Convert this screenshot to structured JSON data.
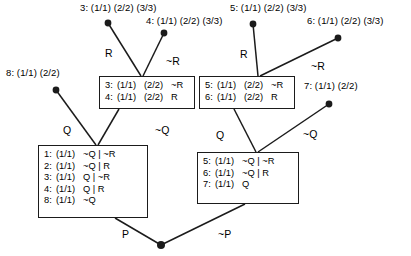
{
  "diagram": {
    "stroke_color": "#1b1b1b",
    "background": "#ffffff",
    "leaf_nodes": [
      {
        "name": "node-3",
        "label": "3: (1/1) (2/2) (3/3)",
        "label_x": 80,
        "label_y": 2,
        "dot_x": 108,
        "dot_y": 23
      },
      {
        "name": "node-4",
        "label": "4: (1/1) (2/2) (3/3)",
        "label_x": 146,
        "label_y": 15,
        "dot_x": 164,
        "dot_y": 33
      },
      {
        "name": "node-5",
        "label": "5: (1/1) (2/2) (3/3)",
        "label_x": 230,
        "label_y": 2,
        "dot_x": 253,
        "dot_y": 24
      },
      {
        "name": "node-6",
        "label": "6: (1/1) (2/2) (3/3)",
        "label_x": 307,
        "label_y": 15,
        "dot_x": 338,
        "dot_y": 38
      },
      {
        "name": "node-8",
        "label": "8: (1/1)  (2/2)",
        "label_x": 6,
        "label_y": 67,
        "dot_x": 56,
        "dot_y": 90
      },
      {
        "name": "node-7",
        "label": "7: (1/1)  (2/2)",
        "label_x": 304,
        "label_y": 80,
        "dot_x": 329,
        "dot_y": 104
      }
    ],
    "root_node": {
      "name": "root-node",
      "dot_x": 161,
      "dot_y": 245
    },
    "edge_labels": [
      {
        "name": "edge-label-r-left",
        "text": "R",
        "x": 105,
        "y": 47
      },
      {
        "name": "edge-label-not-r-left",
        "text": "~R",
        "x": 166,
        "y": 55
      },
      {
        "name": "edge-label-r-right",
        "text": "R",
        "x": 240,
        "y": 48
      },
      {
        "name": "edge-label-not-r-right",
        "text": "~R",
        "x": 311,
        "y": 60
      },
      {
        "name": "edge-label-q-left",
        "text": "Q",
        "x": 63,
        "y": 124
      },
      {
        "name": "edge-label-not-q-left",
        "text": "~Q",
        "x": 155,
        "y": 124
      },
      {
        "name": "edge-label-q-right",
        "text": "Q",
        "x": 216,
        "y": 129
      },
      {
        "name": "edge-label-not-q-right",
        "text": "~Q",
        "x": 303,
        "y": 128
      },
      {
        "name": "edge-label-p",
        "text": "P",
        "x": 122,
        "y": 228
      },
      {
        "name": "edge-label-not-p",
        "text": "~P",
        "x": 218,
        "y": 228
      }
    ],
    "boxes": [
      {
        "name": "box-upper-left",
        "x": 99,
        "y": 76,
        "w": 96,
        "h": 33,
        "rows": [
          {
            "idx": "3:",
            "c1": "(1/1)",
            "c2": "(2/2)",
            "c3": "~R"
          },
          {
            "idx": "4:",
            "c1": "(1/1)",
            "c2": "(2/2)",
            "c3": "R"
          }
        ]
      },
      {
        "name": "box-upper-right",
        "x": 199,
        "y": 76,
        "w": 96,
        "h": 33,
        "rows": [
          {
            "idx": "5:",
            "c1": "(1/1)",
            "c2": "(2/2)",
            "c3": "~R"
          },
          {
            "idx": "6:",
            "c1": "(1/1)",
            "c2": "(2/2)",
            "c3": "R"
          }
        ]
      },
      {
        "name": "box-lower-left",
        "x": 38,
        "y": 145,
        "w": 110,
        "h": 73,
        "rows": [
          {
            "idx": "1:",
            "c1": "(1/1)",
            "c2": "~Q | ~R",
            "c3": ""
          },
          {
            "idx": "2:",
            "c1": "(1/1)",
            "c2": "~Q | R",
            "c3": ""
          },
          {
            "idx": "3:",
            "c1": "(1/1)",
            "c2": "Q | ~R",
            "c3": ""
          },
          {
            "idx": "4:",
            "c1": "(1/1)",
            "c2": "Q | R",
            "c3": ""
          },
          {
            "idx": "8:",
            "c1": "(1/1)",
            "c2": "~Q",
            "c3": ""
          }
        ]
      },
      {
        "name": "box-lower-right",
        "x": 197,
        "y": 152,
        "w": 102,
        "h": 52,
        "rows": [
          {
            "idx": "5:",
            "c1": "(1/1)",
            "c2": "~Q | ~R",
            "c3": ""
          },
          {
            "idx": "6:",
            "c1": "(1/1)",
            "c2": "~Q | R",
            "c3": ""
          },
          {
            "idx": "7:",
            "c1": "(1/1)",
            "c2": "Q",
            "c3": ""
          }
        ]
      }
    ],
    "edges": [
      {
        "name": "edge-node3-to-box-upper-left",
        "x1": 108,
        "y1": 23,
        "x2": 141,
        "y2": 76
      },
      {
        "name": "edge-node4-to-box-upper-left",
        "x1": 164,
        "y1": 33,
        "x2": 143,
        "y2": 76
      },
      {
        "name": "edge-node5-to-box-upper-right",
        "x1": 253,
        "y1": 24,
        "x2": 258,
        "y2": 76
      },
      {
        "name": "edge-node6-to-box-upper-right",
        "x1": 338,
        "y1": 38,
        "x2": 260,
        "y2": 76
      },
      {
        "name": "edge-node8-to-box-lower-left",
        "x1": 56,
        "y1": 90,
        "x2": 96,
        "y2": 145
      },
      {
        "name": "edge-box-upper-left-to-lower-left",
        "x1": 119,
        "y1": 109,
        "x2": 98,
        "y2": 145
      },
      {
        "name": "edge-box-upper-right-to-lower-right",
        "x1": 234,
        "y1": 109,
        "x2": 256,
        "y2": 152
      },
      {
        "name": "edge-node7-to-box-lower-right",
        "x1": 329,
        "y1": 104,
        "x2": 258,
        "y2": 152
      },
      {
        "name": "edge-box-lower-left-to-root",
        "x1": 115,
        "y1": 218,
        "x2": 161,
        "y2": 245
      },
      {
        "name": "edge-box-lower-right-to-root",
        "x1": 245,
        "y1": 204,
        "x2": 161,
        "y2": 245
      }
    ]
  }
}
